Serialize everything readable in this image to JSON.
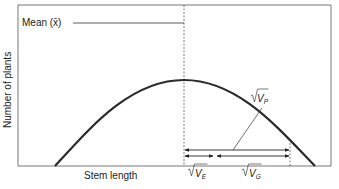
{
  "diagram": {
    "type": "normal-distribution-variance-partition",
    "mean_label": "Mean (x̄)",
    "x_axis_label": "Stem length",
    "y_axis_label": "Number of plants",
    "components": {
      "phenotypic": {
        "symbol": "V",
        "subscript": "P",
        "label": "√V_P"
      },
      "environmental": {
        "symbol": "V",
        "subscript": "E",
        "label": "√V_E"
      },
      "genetic": {
        "symbol": "V",
        "subscript": "G",
        "label": "√V_G"
      }
    },
    "colors": {
      "line": "#222222",
      "curve": "#2a2a2a",
      "frame": "#555555",
      "background": "#ffffff"
    }
  }
}
